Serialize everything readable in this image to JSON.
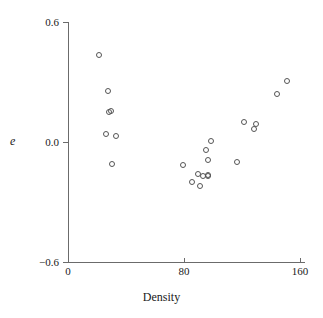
{
  "chart_data": {
    "type": "scatter",
    "title": "",
    "xlabel": "Density",
    "ylabel": "e",
    "xlim": [
      0,
      160
    ],
    "ylim": [
      -0.6,
      0.6
    ],
    "xticks": [
      0,
      80,
      160
    ],
    "xtick_labels": [
      "0",
      "80",
      "160"
    ],
    "yticks": [
      -0.6,
      0.0,
      0.6
    ],
    "ytick_labels": [
      "−0.6",
      "0.0",
      "0.6"
    ],
    "grid": false,
    "legend": null,
    "marker": "open-circle",
    "marker_color": "#555555",
    "axis_color": "#6b6b6b",
    "points": [
      {
        "x": 21,
        "y": 0.44
      },
      {
        "x": 27,
        "y": 0.26
      },
      {
        "x": 28,
        "y": 0.155
      },
      {
        "x": 29,
        "y": 0.16
      },
      {
        "x": 26,
        "y": 0.045
      },
      {
        "x": 33,
        "y": 0.035
      },
      {
        "x": 30,
        "y": -0.105
      },
      {
        "x": 79,
        "y": -0.11
      },
      {
        "x": 89,
        "y": -0.155
      },
      {
        "x": 85,
        "y": -0.195
      },
      {
        "x": 91,
        "y": -0.215
      },
      {
        "x": 93,
        "y": -0.165
      },
      {
        "x": 96,
        "y": -0.165
      },
      {
        "x": 96,
        "y": -0.16
      },
      {
        "x": 96,
        "y": -0.085
      },
      {
        "x": 95,
        "y": -0.035
      },
      {
        "x": 98,
        "y": 0.01
      },
      {
        "x": 116,
        "y": -0.095
      },
      {
        "x": 121,
        "y": 0.105
      },
      {
        "x": 129,
        "y": 0.095
      },
      {
        "x": 128,
        "y": 0.07
      },
      {
        "x": 144,
        "y": 0.245
      },
      {
        "x": 151,
        "y": 0.31
      }
    ]
  },
  "axes": {
    "y_title": "e",
    "x_title": "Density",
    "y_tick_labels": [
      "0.6",
      "0.0",
      "−0.6"
    ],
    "x_tick_labels": [
      "0",
      "80",
      "160"
    ]
  }
}
